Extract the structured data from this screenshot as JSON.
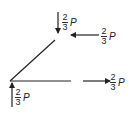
{
  "diagram": {
    "members": [
      {
        "name": "diagonal-member"
      },
      {
        "name": "horizontal-member"
      }
    ],
    "forces": [
      {
        "name": "top-force",
        "direction": "down",
        "numerator": "2",
        "denominator": "3",
        "symbol": "P"
      },
      {
        "name": "right-upper-force",
        "direction": "left",
        "numerator": "2",
        "denominator": "3",
        "symbol": "P"
      },
      {
        "name": "right-lower-force",
        "direction": "right",
        "numerator": "2",
        "denominator": "3",
        "symbol": "P"
      },
      {
        "name": "bottom-force",
        "direction": "up",
        "numerator": "2",
        "denominator": "3",
        "symbol": "P"
      }
    ],
    "colors": {
      "ink": "#222222",
      "background": "#ffffff"
    }
  }
}
